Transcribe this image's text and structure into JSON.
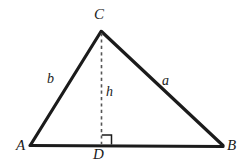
{
  "figure": {
    "kind": "geometry-diagram",
    "background_color": "#ffffff",
    "stroke_color": "#1b1b1b",
    "dash_color": "#555555",
    "labels": {
      "vertex_a": "A",
      "vertex_b": "B",
      "vertex_c": "C",
      "foot_d": "D",
      "side_a": "a",
      "side_b": "b",
      "height": "h"
    },
    "geometry": {
      "points": {
        "A": [
          30,
          145
        ],
        "B": [
          223,
          146
        ],
        "C": [
          101,
          31
        ],
        "D": [
          101,
          145
        ]
      },
      "base_line": "A-B",
      "left_side": "A-C",
      "right_side": "C-B",
      "altitude": "C-D",
      "right_angle_at": "D",
      "right_angle_marker_size": 10
    }
  }
}
